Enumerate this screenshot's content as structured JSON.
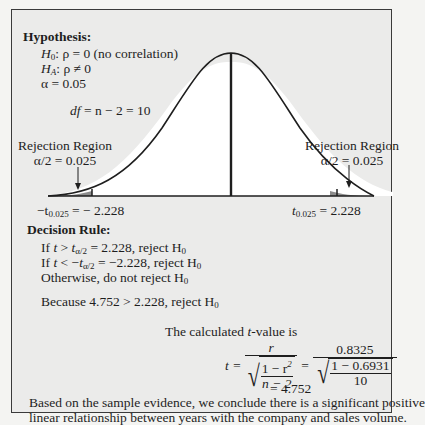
{
  "hypothesis": {
    "heading": "Hypothesis:",
    "h0_sym": "H",
    "h0_sub": "0",
    "h0_rest": ": ρ = 0 (no correlation)",
    "ha_sym": "H",
    "ha_sub": "A",
    "ha_rest": ": ρ ≠ 0",
    "alpha": "α = 0.05",
    "df_sym": "df",
    "df_rest": " = n − 2 = 10"
  },
  "chart": {
    "left_region_title": "Rejection Region",
    "left_region_alpha": "α/2 = 0.025",
    "right_region_title": "Rejection Region",
    "right_region_alpha": "α/2 = 0.025",
    "left_critical_prefix": "−t",
    "left_critical_sub": "0.025",
    "left_critical_value": " = − 2.228",
    "right_critical_prefix": "t",
    "right_critical_sub": "0.025",
    "right_critical_value": " = 2.228",
    "curve_color": "#1e1e1e",
    "tail_fill": "#8c8c8c",
    "body_fill": "#ffffff"
  },
  "decision": {
    "heading": "Decision Rule:",
    "rule1_a": "If ",
    "rule1_t": "t",
    "rule1_b": " > ",
    "rule1_t2": "t",
    "rule1_sub": "α/2",
    "rule1_c": " = 2.228, reject H",
    "rule1_hsub": "0",
    "rule2_a": "If ",
    "rule2_t": "t",
    "rule2_b": " < −",
    "rule2_t2": "t",
    "rule2_sub": "α/2",
    "rule2_c": " = −2.228, reject H",
    "rule2_hsub": "0",
    "rule3": "Otherwise, do not reject H",
    "rule3_hsub": "0",
    "because": "Because 4.752 > 2.228, reject H",
    "because_hsub": "0"
  },
  "calculation": {
    "intro_a": "The calculated ",
    "intro_t": "t",
    "intro_b": "-value is",
    "t_eq": "t =",
    "num_r": "r",
    "rad_num": "1 − r",
    "rad_num_sup": "2",
    "rad_den": "n − 2",
    "eq2": "=",
    "num_val": "0.8325",
    "rad_num_val": "1 − 0.6931",
    "rad_den_val": "10",
    "result": "= 4.752"
  },
  "conclusion": {
    "line1": "Based on the sample evidence, we conclude there is a significant positive",
    "line2": "linear relationship between years with the company and sales volume."
  }
}
